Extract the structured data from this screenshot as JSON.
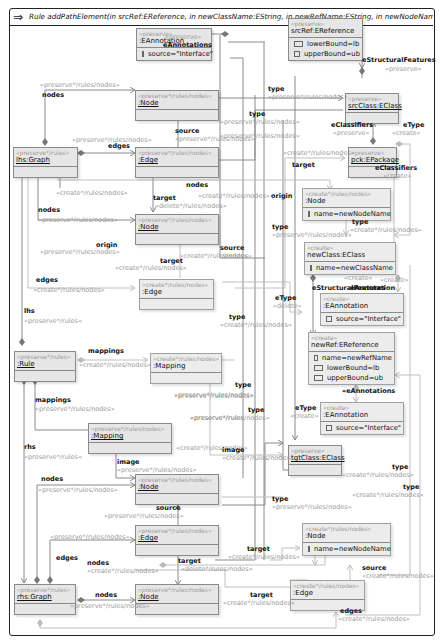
{
  "title": {
    "icon": "rule-arrow-icon",
    "text": "Rule addPathElement(in srcRef:EReference, in newClassName:EString, in newRefName:EString, in newNodeName:EString, i..."
  },
  "nodes": {
    "eannotation_top": {
      "stereotype": "«preserve»",
      "name": ":EAnnotation",
      "attrs": [
        "source=\"Interface\""
      ]
    },
    "srcref": {
      "stereotype": "«preserve»",
      "name": "srcRef:EReference",
      "attrs": [
        "lowerBound=lb",
        "upperBound=ub"
      ]
    },
    "srcclass": {
      "stereotype": "«preserve»",
      "name": "srcClass:EClass",
      "attrs": []
    },
    "pck": {
      "stereotype": "«preserve»",
      "name": "pck:EPackage",
      "attrs": []
    },
    "lhs_node1": {
      "stereotype": "«preserve*/rules/nodes»",
      "name": ":Node",
      "attrs": []
    },
    "lhs_graph": {
      "stereotype": "«preserve*/rules»",
      "name": "lhs:Graph",
      "attrs": []
    },
    "lhs_edge": {
      "stereotype": "«preserve*/rules/nodes»",
      "name": ":Edge",
      "attrs": []
    },
    "lhs_node2": {
      "stereotype": "«preserve*/rules/nodes»",
      "name": ":Node",
      "attrs": []
    },
    "new_node_top": {
      "stereotype": "«create*/rules/nodes»",
      "name": ":Node",
      "attrs": [
        "name=newNodeName"
      ]
    },
    "newclass": {
      "stereotype": "«create»",
      "name": "newClass:EClass",
      "attrs": [
        "name=newClassName"
      ]
    },
    "new_edge_top": {
      "stereotype": "«create*/rules/nodes»",
      "name": ":Edge",
      "attrs": []
    },
    "eannotation_mid": {
      "stereotype": "«create»",
      "name": ":EAnnotation",
      "attrs": [
        "source=\"Interface\""
      ]
    },
    "rule": {
      "stereotype": "«preserve*/rules»",
      "name": ":Rule",
      "attrs": []
    },
    "mapping_create": {
      "stereotype": "«create*/rules/nodes»",
      "name": ":Mapping",
      "attrs": []
    },
    "newref": {
      "stereotype": "«create»",
      "name": "newRef:EReference",
      "attrs": [
        "name=newRefName",
        "lowerBound=lb",
        "upperBound=ub"
      ]
    },
    "eannotation_low": {
      "stereotype": "«create»",
      "name": ":EAnnotation",
      "attrs": [
        "source=\"Interface\""
      ]
    },
    "mapping": {
      "stereotype": "«preserve*/rules/nodes»",
      "name": ":Mapping",
      "attrs": []
    },
    "tgtclass": {
      "stereotype": "«preserve»",
      "name": "tgtClass:EClass",
      "attrs": []
    },
    "rhs_node1": {
      "stereotype": "«preserve*/rules/nodes»",
      "name": ":Node",
      "attrs": []
    },
    "rhs_edge": {
      "stereotype": "«preserve*/rules/nodes»",
      "name": ":Edge",
      "attrs": []
    },
    "new_node_bottom": {
      "stereotype": "«create*/rules/nodes»",
      "name": ":Node",
      "attrs": [
        "name=newNodeName"
      ]
    },
    "rhs_graph": {
      "stereotype": "«preserve*/rules»",
      "name": "rhs:Graph",
      "attrs": []
    },
    "rhs_node2": {
      "stereotype": "«preserve*/rules/nodes»",
      "name": ":Node",
      "attrs": []
    },
    "new_edge_bottom": {
      "stereotype": "«create*/rules/nodes»",
      "name": ":Edge",
      "attrs": []
    }
  },
  "labels": [
    {
      "x": 165,
      "y": 39,
      "role": "«preserve»",
      "kind": "s"
    },
    {
      "x": 163,
      "y": 47,
      "role": "eAnnotations",
      "kind": "r"
    },
    {
      "x": 362,
      "y": 62,
      "role": "eStructuralFeatures",
      "kind": "r"
    },
    {
      "x": 385,
      "y": 71,
      "role": "«preserve»",
      "kind": "s"
    },
    {
      "x": 40,
      "y": 87,
      "role": "«preserve*/rules/nodes»",
      "kind": "s"
    },
    {
      "x": 42,
      "y": 97,
      "role": "nodes",
      "kind": "r"
    },
    {
      "x": 268,
      "y": 91,
      "role": "type",
      "kind": "r"
    },
    {
      "x": 268,
      "y": 99,
      "role": "«preserve*/rules/nodes»",
      "kind": "s"
    },
    {
      "x": 249,
      "y": 116,
      "role": "type",
      "kind": "r"
    },
    {
      "x": 220,
      "y": 124,
      "role": "«preserve*/rules/nodes»",
      "kind": "s"
    },
    {
      "x": 220,
      "y": 138,
      "role": "«preserve*/rules/nodes»",
      "kind": "s"
    },
    {
      "x": 175,
      "y": 133,
      "role": "source",
      "kind": "r"
    },
    {
      "x": 175,
      "y": 141,
      "role": "«preserve*/rules/nodes»",
      "kind": "s"
    },
    {
      "x": 72,
      "y": 142,
      "role": "«preserve*/rules/nodes»",
      "kind": "s"
    },
    {
      "x": 108,
      "y": 148,
      "role": "edges",
      "kind": "r"
    },
    {
      "x": 331,
      "y": 127,
      "role": "eClassifiers",
      "kind": "r"
    },
    {
      "x": 333,
      "y": 135,
      "role": "«preserve»",
      "kind": "s"
    },
    {
      "x": 403,
      "y": 127,
      "role": "eType",
      "kind": "r"
    },
    {
      "x": 392,
      "y": 135,
      "role": "«create»",
      "kind": "s"
    },
    {
      "x": 283,
      "y": 155,
      "role": "«create*/rules/nodes»",
      "kind": "s"
    },
    {
      "x": 292,
      "y": 167,
      "role": "target",
      "kind": "r"
    },
    {
      "x": 375,
      "y": 170,
      "role": "eClassifiers",
      "kind": "r"
    },
    {
      "x": 383,
      "y": 178,
      "role": "«create»",
      "kind": "s"
    },
    {
      "x": 186,
      "y": 187,
      "role": "nodes",
      "kind": "r"
    },
    {
      "x": 56,
      "y": 195,
      "role": "«create*/rules/nodes»",
      "kind": "s"
    },
    {
      "x": 198,
      "y": 198,
      "role": "«create*/rules/nodes»",
      "kind": "s"
    },
    {
      "x": 153,
      "y": 200,
      "role": "target",
      "kind": "r"
    },
    {
      "x": 155,
      "y": 208,
      "role": "«delete*/rules/nodes»",
      "kind": "s"
    },
    {
      "x": 38,
      "y": 212,
      "role": "nodes",
      "kind": "r"
    },
    {
      "x": 38,
      "y": 222,
      "role": "«preserve*/rules/nodes»",
      "kind": "s"
    },
    {
      "x": 271,
      "y": 198,
      "role": "origin",
      "kind": "r"
    },
    {
      "x": 352,
      "y": 224,
      "role": "type",
      "kind": "r"
    },
    {
      "x": 350,
      "y": 232,
      "role": "«create*/rules/nodes»",
      "kind": "s"
    },
    {
      "x": 96,
      "y": 247,
      "role": "origin",
      "kind": "r"
    },
    {
      "x": 40,
      "y": 254,
      "role": "«preserve*/rules/nodes»",
      "kind": "s"
    },
    {
      "x": 272,
      "y": 229,
      "role": "type",
      "kind": "r"
    },
    {
      "x": 272,
      "y": 237,
      "role": "«preserve*/rules/nodes»",
      "kind": "s"
    },
    {
      "x": 160,
      "y": 263,
      "role": "target",
      "kind": "r"
    },
    {
      "x": 115,
      "y": 270,
      "role": "«create*/rules/nodes»",
      "kind": "s"
    },
    {
      "x": 180,
      "y": 258,
      "role": "«create*/rules/nodes»",
      "kind": "s"
    },
    {
      "x": 220,
      "y": 250,
      "role": "source",
      "kind": "r"
    },
    {
      "x": 222,
      "y": 258,
      "role": "/nodes»",
      "kind": "s"
    },
    {
      "x": 36,
      "y": 282,
      "role": "edges",
      "kind": "r"
    },
    {
      "x": 33,
      "y": 292,
      "role": "«create*/rules/nodes»",
      "kind": "s"
    },
    {
      "x": 344,
      "y": 280,
      "role": "«create»",
      "kind": "s"
    },
    {
      "x": 350,
      "y": 290,
      "role": "eAnnotation",
      "kind": "r"
    },
    {
      "x": 380,
      "y": 282,
      "role": "«create»",
      "kind": "s"
    },
    {
      "x": 312,
      "y": 290,
      "role": "eStructuralFeatures",
      "kind": "r"
    },
    {
      "x": 275,
      "y": 300,
      "role": "eType",
      "kind": "r"
    },
    {
      "x": 273,
      "y": 308,
      "role": "«delete»",
      "kind": "s"
    },
    {
      "x": 229,
      "y": 319,
      "role": "type",
      "kind": "r"
    },
    {
      "x": 220,
      "y": 327,
      "role": "«create*/rules/nodes»",
      "kind": "s"
    },
    {
      "x": 24,
      "y": 313,
      "role": "lhs",
      "kind": "r"
    },
    {
      "x": 24,
      "y": 323,
      "role": "«preserve*/rules»",
      "kind": "s"
    },
    {
      "x": 88,
      "y": 353,
      "role": "mappings",
      "kind": "r"
    },
    {
      "x": 79,
      "y": 367,
      "role": "«create*/rules/nodes»",
      "kind": "s"
    },
    {
      "x": 174,
      "y": 398,
      "role": "«preserve*/rules/nodes»",
      "kind": "s"
    },
    {
      "x": 190,
      "y": 420,
      "role": "«preserve*/rules",
      "kind": "s"
    },
    {
      "x": 235,
      "y": 387,
      "role": "type",
      "kind": "r"
    },
    {
      "x": 174,
      "y": 397,
      "role": "«preserve*/rules/nodes»",
      "kind": "s"
    },
    {
      "x": 35,
      "y": 402,
      "role": "mappings",
      "kind": "r"
    },
    {
      "x": 35,
      "y": 411,
      "role": "«preserve*/rules/nodes»",
      "kind": "s"
    },
    {
      "x": 248,
      "y": 412,
      "role": "type",
      "kind": "r"
    },
    {
      "x": 190,
      "y": 420,
      "role": "«preserve*/rules/nodes»",
      "kind": "s"
    },
    {
      "x": 295,
      "y": 410,
      "role": "eType",
      "kind": "r"
    },
    {
      "x": 290,
      "y": 418,
      "role": "«create»",
      "kind": "s"
    },
    {
      "x": 342,
      "y": 393,
      "role": "«eAnnotations",
      "kind": "r"
    },
    {
      "x": 24,
      "y": 449,
      "role": "rhs",
      "kind": "r"
    },
    {
      "x": 24,
      "y": 459,
      "role": "«preserve*/rules»",
      "kind": "s"
    },
    {
      "x": 176,
      "y": 450,
      "role": "«create*/rules/nodes»",
      "kind": "s"
    },
    {
      "x": 222,
      "y": 452,
      "role": "image",
      "kind": "r"
    },
    {
      "x": 222,
      "y": 460,
      "role": "«create*/rules/nodes»",
      "kind": "s"
    },
    {
      "x": 117,
      "y": 464,
      "role": "image",
      "kind": "r"
    },
    {
      "x": 117,
      "y": 472,
      "role": "«preserve*/rules/nodes»",
      "kind": "s"
    },
    {
      "x": 392,
      "y": 469,
      "role": "type",
      "kind": "r"
    },
    {
      "x": 342,
      "y": 477,
      "role": "«create*/rules/nodes»",
      "kind": "s"
    },
    {
      "x": 403,
      "y": 489,
      "role": "type",
      "kind": "r"
    },
    {
      "x": 352,
      "y": 497,
      "role": "«create*/rules/nodes»",
      "kind": "s"
    },
    {
      "x": 41,
      "y": 481,
      "role": "nodes",
      "kind": "r"
    },
    {
      "x": 38,
      "y": 492,
      "role": "«preserve*/rules/nodes»",
      "kind": "s"
    },
    {
      "x": 272,
      "y": 501,
      "role": "type",
      "kind": "r"
    },
    {
      "x": 272,
      "y": 509,
      "role": "«preserve*/rules/nodes»",
      "kind": "s"
    },
    {
      "x": 156,
      "y": 510,
      "role": "source",
      "kind": "r"
    },
    {
      "x": 104,
      "y": 518,
      "role": "«preserve*/rules/nodes»",
      "kind": "s"
    },
    {
      "x": 50,
      "y": 539,
      "role": "«preserve*/rules/nodes»",
      "kind": "s"
    },
    {
      "x": 56,
      "y": 560,
      "role": "edges",
      "kind": "r"
    },
    {
      "x": 247,
      "y": 551,
      "role": "target",
      "kind": "r"
    },
    {
      "x": 228,
      "y": 559,
      "role": "«create*/rules/nodes»",
      "kind": "s"
    },
    {
      "x": 87,
      "y": 565,
      "role": "nodes",
      "kind": "r"
    },
    {
      "x": 87,
      "y": 573,
      "role": "«create*/rules/nodes»",
      "kind": "s"
    },
    {
      "x": 178,
      "y": 563,
      "role": "target",
      "kind": "r"
    },
    {
      "x": 181,
      "y": 571,
      "role": "«delete*/rules/nodes»",
      "kind": "s"
    },
    {
      "x": 362,
      "y": 570,
      "role": "source",
      "kind": "r"
    },
    {
      "x": 362,
      "y": 578,
      "role": "«create*/rules/nodes»",
      "kind": "s"
    },
    {
      "x": 95,
      "y": 597,
      "role": "nodes",
      "kind": "r"
    },
    {
      "x": 70,
      "y": 608,
      "role": "«preserve*/rules/nodes»",
      "kind": "s"
    },
    {
      "x": 250,
      "y": 597,
      "role": "target",
      "kind": "r"
    },
    {
      "x": 223,
      "y": 605,
      "role": "«create*/rules/nodes»",
      "kind": "s"
    },
    {
      "x": 340,
      "y": 613,
      "role": "edges",
      "kind": "r"
    },
    {
      "x": 338,
      "y": 621,
      "role": "«create*/rules/nodes»",
      "kind": "s"
    }
  ]
}
